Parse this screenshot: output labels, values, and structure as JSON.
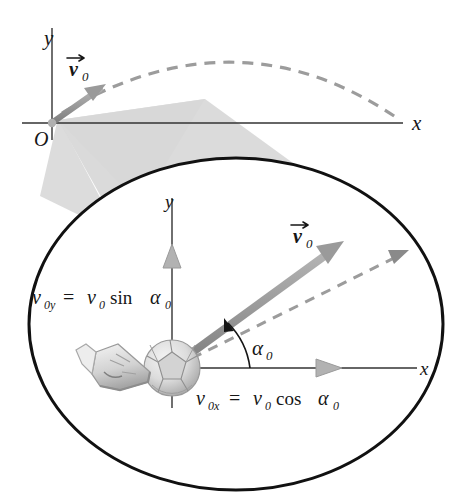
{
  "colors": {
    "ink": "#161616",
    "vector_gray": "#9a9a9a",
    "vector_gray_dark": "#8a8a8a",
    "dashed_gray": "#9c9c9c",
    "cone_fill": "#d8d8d8",
    "ellipse_outline": "#111111",
    "ball_light": "#ececec",
    "ball_mid": "#cfcfcf",
    "ball_dark": "#9c9c9c",
    "shoe_gray": "#b4b4b4",
    "page_background": "#ffffff"
  },
  "overview": {
    "name": "projectile-overview-panel",
    "axis_y_label": "y",
    "axis_x_label": "x",
    "origin_label": "O",
    "velocity_vector_label": "v",
    "velocity_vector_subscript": "0",
    "trajectory_style": "dashed",
    "trajectory_shape": "parabola"
  },
  "magnifier": {
    "name": "magnified-callout-ellipse",
    "axis_y_label": "y",
    "axis_x_label": "x",
    "velocity_vector_label": "v",
    "velocity_vector_subscript": "0",
    "angle_label": "α",
    "angle_subscript": "0",
    "component_y": {
      "symbol": "v",
      "symbol_sub": "0y",
      "equals": "=",
      "expr_symbol": "v",
      "expr_sub": "0",
      "trig": "sin",
      "angle": "α",
      "angle_sub": "0",
      "full_text": "v0y = v0 sin α0"
    },
    "component_x": {
      "symbol": "v",
      "symbol_sub": "0x",
      "equals": "=",
      "expr_symbol": "v",
      "expr_sub": "0",
      "trig": "cos",
      "angle": "α",
      "angle_sub": "0",
      "full_text": "v0x = v0 cos α0"
    },
    "ball_name": "soccer-ball",
    "shoe_name": "kicking-shoe"
  }
}
